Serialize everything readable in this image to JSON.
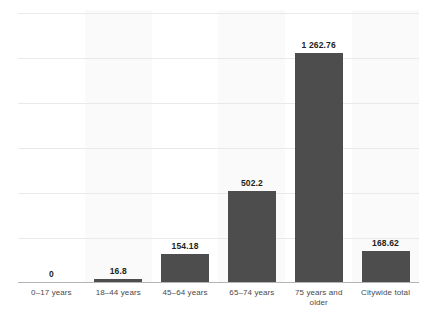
{
  "chart_data": {
    "type": "bar",
    "title": "",
    "subtitle": "",
    "xlabel": "",
    "ylabel": "",
    "ylim": [
      0,
      1500
    ],
    "grid": true,
    "legend": "none",
    "gridline_count": 6,
    "categories": [
      "0–17 years",
      "18–44 years",
      "45–64 years",
      "65–74 years",
      "75 years and older",
      "Citywide total"
    ],
    "category_lines": [
      [
        "0–17 years"
      ],
      [
        "18–44 years"
      ],
      [
        "45–64 years"
      ],
      [
        "65–74 years"
      ],
      [
        "75 years and",
        "older"
      ],
      [
        "Citywide total"
      ]
    ],
    "values": [
      0,
      16.8,
      154.18,
      502.2,
      1262.76,
      168.62
    ],
    "value_labels": [
      "0",
      "16.8",
      "154.18",
      "502.2",
      "1 262.76",
      "168.62"
    ],
    "colors": {
      "bar": "#4d4d4d",
      "band_shade": "#fafafa",
      "band_plain": "#ffffff",
      "gridline": "#e9e9e9",
      "axis_line": "#b5b5b5",
      "value_label_text": "#231f20",
      "category_label_text": "#4a4a4a",
      "background": "#ffffff"
    }
  }
}
